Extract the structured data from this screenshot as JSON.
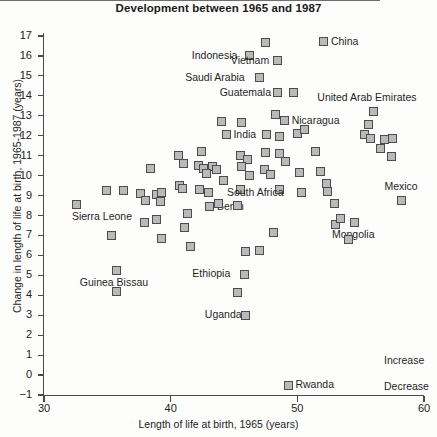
{
  "chart_data": {
    "type": "scatter",
    "title": "Development between 1965 and 1987",
    "xlabel": "Length of life at birth, 1965 (years)",
    "ylabel": "Change in length of life at birth, 1965-1987 (years)",
    "xlim": [
      30,
      60
    ],
    "ylim": [
      -1,
      17
    ],
    "xticks": [
      30,
      40,
      50,
      60
    ],
    "yticks": [
      -1,
      0,
      1,
      2,
      3,
      4,
      5,
      6,
      7,
      8,
      9,
      10,
      11,
      12,
      13,
      14,
      15,
      16,
      17
    ],
    "grid": false,
    "legend": "none",
    "zero_reference_line": 0,
    "annotations": [
      {
        "text": "Increase",
        "x": 57.0,
        "y": 0.7
      },
      {
        "text": "Decrease",
        "x": 57.0,
        "y": -0.6
      }
    ],
    "points": [
      {
        "label": "Sierra Leone",
        "x": 32.6,
        "y": 8.55,
        "label_pos": "below-left"
      },
      {
        "label": "",
        "x": 34.9,
        "y": 9.25
      },
      {
        "label": "",
        "x": 35.3,
        "y": 7.0
      },
      {
        "label": "",
        "x": 36.3,
        "y": 9.25
      },
      {
        "label": "Guinea Bissau",
        "x": 35.7,
        "y": 5.25,
        "label_pos": "below"
      },
      {
        "label": "",
        "x": 35.7,
        "y": 4.2
      },
      {
        "label": "",
        "x": 37.6,
        "y": 9.1
      },
      {
        "label": "",
        "x": 38.0,
        "y": 8.75
      },
      {
        "label": "",
        "x": 38.4,
        "y": 10.35
      },
      {
        "label": "",
        "x": 38.9,
        "y": 9.05
      },
      {
        "label": "",
        "x": 39.2,
        "y": 8.7
      },
      {
        "label": "",
        "x": 39.3,
        "y": 9.15
      },
      {
        "label": "",
        "x": 37.9,
        "y": 7.65
      },
      {
        "label": "",
        "x": 38.9,
        "y": 7.8
      },
      {
        "label": "",
        "x": 39.3,
        "y": 6.85
      },
      {
        "label": "",
        "x": 40.6,
        "y": 11.0
      },
      {
        "label": "",
        "x": 41.0,
        "y": 10.6
      },
      {
        "label": "",
        "x": 40.7,
        "y": 9.5
      },
      {
        "label": "",
        "x": 40.9,
        "y": 9.35
      },
      {
        "label": "",
        "x": 41.3,
        "y": 8.1
      },
      {
        "label": "",
        "x": 41.1,
        "y": 7.4
      },
      {
        "label": "",
        "x": 41.6,
        "y": 6.45
      },
      {
        "label": "",
        "x": 42.4,
        "y": 11.2
      },
      {
        "label": "",
        "x": 42.2,
        "y": 10.5
      },
      {
        "label": "",
        "x": 42.6,
        "y": 10.35
      },
      {
        "label": "",
        "x": 43.3,
        "y": 10.45
      },
      {
        "label": "",
        "x": 43.6,
        "y": 10.3
      },
      {
        "label": "",
        "x": 42.8,
        "y": 10.1
      },
      {
        "label": "",
        "x": 42.3,
        "y": 9.3
      },
      {
        "label": "",
        "x": 43.0,
        "y": 9.15
      },
      {
        "label": "Benin",
        "x": 43.1,
        "y": 8.45,
        "label_pos": "right"
      },
      {
        "label": "",
        "x": 43.8,
        "y": 8.6
      },
      {
        "label": "",
        "x": 44.2,
        "y": 9.75
      },
      {
        "label": "",
        "x": 44.0,
        "y": 12.7
      },
      {
        "label": "India",
        "x": 44.4,
        "y": 12.05,
        "label_pos": "right"
      },
      {
        "label": "",
        "x": 45.6,
        "y": 12.65
      },
      {
        "label": "",
        "x": 45.5,
        "y": 11.0
      },
      {
        "label": "",
        "x": 46.1,
        "y": 10.8
      },
      {
        "label": "",
        "x": 45.6,
        "y": 10.45
      },
      {
        "label": "",
        "x": 46.2,
        "y": 10.0
      },
      {
        "label": "",
        "x": 45.5,
        "y": 9.3
      },
      {
        "label": "",
        "x": 45.3,
        "y": 8.5
      },
      {
        "label": "Ethiopia",
        "x": 45.8,
        "y": 5.05,
        "label_pos": "left"
      },
      {
        "label": "",
        "x": 45.3,
        "y": 4.15
      },
      {
        "label": "Uganda",
        "x": 45.9,
        "y": 3.0,
        "label_pos": "left"
      },
      {
        "label": "",
        "x": 45.9,
        "y": 6.2
      },
      {
        "label": "Indonesia",
        "x": 46.2,
        "y": 16.0,
        "label_pos": "left"
      },
      {
        "label": "Saudi Arabia",
        "x": 47.0,
        "y": 14.9,
        "label_pos": "left"
      },
      {
        "label": "",
        "x": 47.5,
        "y": 16.65
      },
      {
        "label": "Vietnam",
        "x": 48.4,
        "y": 15.75,
        "label_pos": "left"
      },
      {
        "label": "Guatemala",
        "x": 48.4,
        "y": 14.15,
        "label_pos": "left"
      },
      {
        "label": "",
        "x": 49.7,
        "y": 14.15
      },
      {
        "label": "",
        "x": 48.3,
        "y": 13.05
      },
      {
        "label": "Nicaragua",
        "x": 49.0,
        "y": 12.75,
        "label_pos": "right"
      },
      {
        "label": "",
        "x": 47.6,
        "y": 12.05
      },
      {
        "label": "",
        "x": 48.6,
        "y": 11.95
      },
      {
        "label": "",
        "x": 50.0,
        "y": 12.1
      },
      {
        "label": "",
        "x": 50.6,
        "y": 12.3
      },
      {
        "label": "",
        "x": 47.5,
        "y": 11.15
      },
      {
        "label": "",
        "x": 48.6,
        "y": 11.1
      },
      {
        "label": "",
        "x": 47.4,
        "y": 10.3
      },
      {
        "label": "",
        "x": 47.9,
        "y": 10.05
      },
      {
        "label": "",
        "x": 49.1,
        "y": 10.7
      },
      {
        "label": "",
        "x": 50.2,
        "y": 10.15
      },
      {
        "label": "",
        "x": 51.4,
        "y": 11.2
      },
      {
        "label": "",
        "x": 51.8,
        "y": 10.2
      },
      {
        "label": "",
        "x": 48.6,
        "y": 9.3
      },
      {
        "label": "South Africa",
        "x": 50.3,
        "y": 9.15,
        "label_pos": "left"
      },
      {
        "label": "",
        "x": 52.3,
        "y": 9.6
      },
      {
        "label": "",
        "x": 52.4,
        "y": 9.2
      },
      {
        "label": "",
        "x": 48.1,
        "y": 7.15
      },
      {
        "label": "",
        "x": 47.0,
        "y": 6.25
      },
      {
        "label": "",
        "x": 52.9,
        "y": 8.6
      },
      {
        "label": "",
        "x": 53.0,
        "y": 7.55
      },
      {
        "label": "",
        "x": 53.4,
        "y": 7.85
      },
      {
        "label": "Mongolia",
        "x": 54.5,
        "y": 7.65,
        "label_pos": "below"
      },
      {
        "label": "",
        "x": 54.0,
        "y": 6.8
      },
      {
        "label": "United Arab Emirates",
        "x": 56.0,
        "y": 13.2,
        "label_pos": "above"
      },
      {
        "label": "",
        "x": 55.6,
        "y": 12.55
      },
      {
        "label": "",
        "x": 55.3,
        "y": 12.05
      },
      {
        "label": "",
        "x": 55.8,
        "y": 11.85
      },
      {
        "label": "",
        "x": 56.9,
        "y": 11.8
      },
      {
        "label": "",
        "x": 57.5,
        "y": 11.85
      },
      {
        "label": "",
        "x": 56.6,
        "y": 11.35
      },
      {
        "label": "",
        "x": 57.4,
        "y": 10.95
      },
      {
        "label": "Mexico",
        "x": 58.2,
        "y": 8.75,
        "label_pos": "above"
      },
      {
        "label": "China",
        "x": 52.1,
        "y": 16.7,
        "label_pos": "right"
      },
      {
        "label": "Rwanda",
        "x": 49.3,
        "y": -0.5,
        "label_pos": "right"
      }
    ]
  },
  "axis": {
    "x_tick_labels": [
      "30",
      "40",
      "50",
      "60"
    ],
    "y_tick_labels": [
      "17",
      "16",
      "15",
      "14",
      "13",
      "12",
      "11",
      "10",
      "9",
      "8",
      "7",
      "6",
      "5",
      "4",
      "3",
      "2",
      "1",
      "0",
      "-1"
    ]
  },
  "labels": {
    "sierra_leone": "Sierra\nLeone",
    "guinea_bissau": "Guinea Bissau",
    "benin": "Benin",
    "india": "India",
    "ethiopia": "Ethiopia",
    "uganda": "Uganda",
    "indonesia": "Indonesia",
    "saudi_arabia": "Saudi Arabia",
    "vietnam": "Vietnam",
    "guatemala": "Guatemala",
    "nicaragua": "Nicaragua",
    "south_africa": "South Africa",
    "mongolia": "Mongolia",
    "uae": "United Arab\nEmirates",
    "mexico": "Mexico",
    "china": "China",
    "rwanda": "Rwanda",
    "increase": "Increase",
    "decrease": "Decrease"
  }
}
